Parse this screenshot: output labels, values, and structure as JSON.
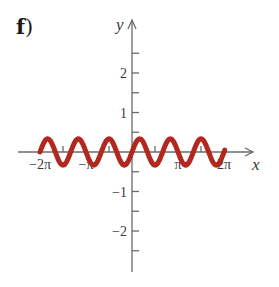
{
  "panel": {
    "letter": "f",
    "paren": ")"
  },
  "colors": {
    "curve": "#b3281e",
    "axis": "#6a6a6a",
    "text": "#3a3a3a"
  },
  "chart_data": {
    "type": "line",
    "title": "",
    "xlabel": "x",
    "ylabel": "y",
    "function": "y = (1/3) sin(3x)",
    "series": [
      {
        "name": "y = (1/3)sin(3x)",
        "amplitude": 0.333,
        "frequency": 3,
        "x_range_rad": [
          -6.2832,
          6.2832
        ]
      }
    ],
    "x_ticks": [
      {
        "value": -6.2832,
        "label": "−2π"
      },
      {
        "value": -4.7124,
        "label": ""
      },
      {
        "value": -3.1416,
        "label": "−π"
      },
      {
        "value": -1.5708,
        "label": ""
      },
      {
        "value": 1.5708,
        "label": ""
      },
      {
        "value": 3.1416,
        "label": "π"
      },
      {
        "value": 4.7124,
        "label": ""
      },
      {
        "value": 6.2832,
        "label": "2π"
      }
    ],
    "y_ticks": [
      {
        "value": 2.5,
        "label": ""
      },
      {
        "value": 2,
        "label": "2"
      },
      {
        "value": 1.5,
        "label": ""
      },
      {
        "value": 1,
        "label": "1"
      },
      {
        "value": 0.5,
        "label": ""
      },
      {
        "value": -0.5,
        "label": ""
      },
      {
        "value": -1,
        "label": "−1"
      },
      {
        "value": -1.5,
        "label": ""
      },
      {
        "value": -2,
        "label": "−2"
      },
      {
        "value": -2.5,
        "label": ""
      }
    ],
    "xlim": [
      -7.5,
      8.0
    ],
    "ylim": [
      -3.0,
      3.3
    ],
    "grid": false,
    "legend": "none"
  }
}
